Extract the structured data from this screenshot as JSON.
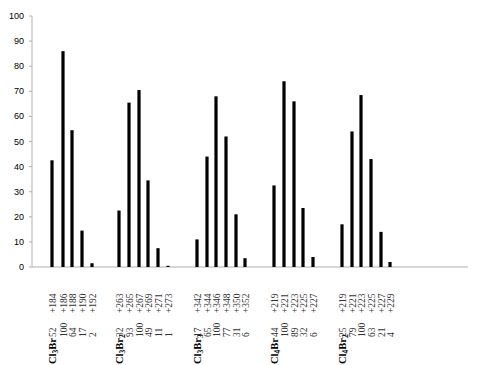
{
  "chart_data": {
    "type": "bar",
    "title": "",
    "xlabel": "",
    "ylabel": "",
    "ylim": [
      0,
      100
    ],
    "yticks": [
      0,
      10,
      20,
      30,
      40,
      50,
      60,
      70,
      80,
      90,
      100
    ],
    "grid": false,
    "legend": null,
    "bar_color": "#000000",
    "axis_color": "#b0b0b0",
    "groups": [
      {
        "name": "Cl3Br",
        "formula_parts": [
          [
            "Cl",
            ""
          ],
          [
            "3",
            "sub"
          ],
          [
            "Br",
            ""
          ]
        ],
        "peaks": [
          {
            "label": "52 +184",
            "expected": 52,
            "mz": "+184",
            "value": 42.5
          },
          {
            "label": "100 +186",
            "expected": 100,
            "mz": "+186",
            "value": 86
          },
          {
            "label": "64 +188",
            "expected": 64,
            "mz": "+188",
            "value": 54.5
          },
          {
            "label": "17 +190",
            "expected": 17,
            "mz": "+190",
            "value": 14.5
          },
          {
            "label": "2 +192",
            "expected": 2,
            "mz": "+192",
            "value": 1.5
          }
        ]
      },
      {
        "name": "Cl3Br2",
        "formula_parts": [
          [
            "Cl",
            ""
          ],
          [
            "3",
            "sub"
          ],
          [
            "Br",
            ""
          ],
          [
            "2",
            "sub"
          ]
        ],
        "peaks": [
          {
            "label": "32 +263",
            "expected": 32,
            "mz": "+263",
            "value": 22.5
          },
          {
            "label": "93 +265",
            "expected": 93,
            "mz": "+265",
            "value": 65.5
          },
          {
            "label": "100 +267",
            "expected": 100,
            "mz": "+267",
            "value": 70.5
          },
          {
            "label": "49 +269",
            "expected": 49,
            "mz": "+269",
            "value": 34.5
          },
          {
            "label": "11 +271",
            "expected": 11,
            "mz": "+271",
            "value": 7.5
          },
          {
            "label": "1 +273",
            "expected": 1,
            "mz": "+273",
            "value": 0.5
          }
        ]
      },
      {
        "name": "Cl3Br3",
        "formula_parts": [
          [
            "Cl",
            ""
          ],
          [
            "3",
            "sub"
          ],
          [
            "Br",
            ""
          ],
          [
            "3",
            "sub"
          ]
        ],
        "peaks": [
          {
            "label": "17 +342",
            "expected": 17,
            "mz": "+342",
            "value": 11
          },
          {
            "label": "65 +344",
            "expected": 65,
            "mz": "+344",
            "value": 44
          },
          {
            "label": "100 +346",
            "expected": 100,
            "mz": "+346",
            "value": 68
          },
          {
            "label": "77 +348",
            "expected": 77,
            "mz": "+348",
            "value": 52
          },
          {
            "label": "31 +350",
            "expected": 31,
            "mz": "+350",
            "value": 21
          },
          {
            "label": "6 +352",
            "expected": 6,
            "mz": "+352",
            "value": 3.5
          }
        ]
      },
      {
        "name": "Cl4Br",
        "formula_parts": [
          [
            "Cl",
            ""
          ],
          [
            "4",
            "sub"
          ],
          [
            "Br",
            ""
          ]
        ],
        "peaks": [
          {
            "label": "44 +219",
            "expected": 44,
            "mz": "+219",
            "value": 32.5
          },
          {
            "label": "100 +221",
            "expected": 100,
            "mz": "+221",
            "value": 74
          },
          {
            "label": "89 +223",
            "expected": 89,
            "mz": "+223",
            "value": 66
          },
          {
            "label": "32 +225",
            "expected": 32,
            "mz": "+225",
            "value": 23.5
          },
          {
            "label": "6 +227",
            "expected": 6,
            "mz": "+227",
            "value": 4
          }
        ]
      },
      {
        "name": "Cl4Br2",
        "formula_parts": [
          [
            "Cl",
            ""
          ],
          [
            "4",
            "sub"
          ],
          [
            "Br",
            ""
          ],
          [
            "2",
            "sub"
          ]
        ],
        "peaks": [
          {
            "label": "25 +219",
            "expected": 25,
            "mz": "+219",
            "value": 17
          },
          {
            "label": "79 +221",
            "expected": 79,
            "mz": "+221",
            "value": 54
          },
          {
            "label": "100 +223",
            "expected": 100,
            "mz": "+223",
            "value": 68.5
          },
          {
            "label": "63 +225",
            "expected": 63,
            "mz": "+225",
            "value": 43
          },
          {
            "label": "21 +227",
            "expected": 21,
            "mz": "+227",
            "value": 14
          },
          {
            "label": "4 +229",
            "expected": 4,
            "mz": "+229",
            "value": 2
          }
        ]
      }
    ]
  },
  "layout": {
    "x0": 32,
    "x_end": 468,
    "y_zero": 267,
    "y_top": 16,
    "bar_width": 3.2,
    "bar_x": [
      [
        52,
        63,
        72,
        82,
        92
      ],
      [
        119,
        129,
        139,
        148,
        158,
        168
      ],
      [
        197,
        207,
        216,
        226,
        236,
        245
      ],
      [
        274,
        284,
        294,
        303,
        313
      ],
      [
        342,
        352,
        361,
        371,
        381,
        390
      ]
    ]
  }
}
